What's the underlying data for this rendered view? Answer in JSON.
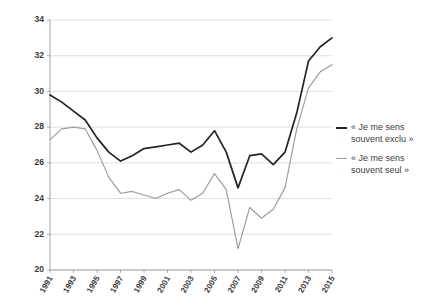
{
  "chart_data": {
    "type": "line",
    "title": "",
    "xlabel": "",
    "ylabel": "",
    "grid": true,
    "legend_position": "right",
    "ylim": [
      20,
      34
    ],
    "yticks": [
      20,
      22,
      24,
      26,
      28,
      30,
      32,
      34
    ],
    "ytick_labels": [
      "20",
      "22",
      "24",
      "26",
      "28",
      "30",
      "32",
      "34"
    ],
    "x": [
      1991,
      1992,
      1993,
      1994,
      1995,
      1996,
      1997,
      1998,
      1999,
      2000,
      2001,
      2002,
      2003,
      2004,
      2005,
      2006,
      2007,
      2008,
      2009,
      2010,
      2011,
      2012,
      2013,
      2014,
      2015
    ],
    "xtick_values": [
      1991,
      1993,
      1995,
      1997,
      1999,
      2001,
      2003,
      2005,
      2007,
      2009,
      2011,
      2013,
      2015
    ],
    "xtick_labels": [
      "1991",
      "1993",
      "1995",
      "1997",
      "1999",
      "2001",
      "2003",
      "2005",
      "2007",
      "2009",
      "2011",
      "2013",
      "2015"
    ],
    "series": [
      {
        "name": "« Je me sens souvent exclu »",
        "color": "#232323",
        "values": [
          29.8,
          29.4,
          28.9,
          28.4,
          27.4,
          26.6,
          26.1,
          26.4,
          26.8,
          26.9,
          27.0,
          27.1,
          26.6,
          27.0,
          27.8,
          26.6,
          24.6,
          26.4,
          26.5,
          25.9,
          26.6,
          28.8,
          31.7,
          32.5,
          33.0
        ]
      },
      {
        "name": "« Je me sens souvent seul »",
        "color": "#9b9b9b",
        "values": [
          27.3,
          27.9,
          28.0,
          27.9,
          26.7,
          25.2,
          24.3,
          24.4,
          24.2,
          24.0,
          24.3,
          24.5,
          23.9,
          24.3,
          25.4,
          24.5,
          21.2,
          23.5,
          22.9,
          23.4,
          24.6,
          27.9,
          30.2,
          31.1,
          31.5
        ]
      }
    ],
    "legend": [
      {
        "label": "« Je me sens\nsouvent exclu »",
        "color": "#232323"
      },
      {
        "label": "« Je me sens\nsouvent seul »",
        "color": "#9b9b9b"
      }
    ]
  }
}
